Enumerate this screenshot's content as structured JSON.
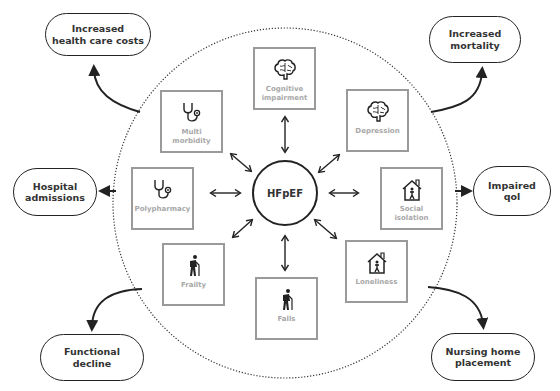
{
  "diagram": {
    "center": {
      "label": "HFpEF"
    },
    "factors": [
      {
        "id": "cognitive-impairment",
        "label": "Cognitive\nimpairment",
        "icon": "brain-icon"
      },
      {
        "id": "multi-morbidity",
        "label": "Multi morbidity",
        "icon": "stethoscope-icon"
      },
      {
        "id": "depression",
        "label": "Depression",
        "icon": "brain-icon"
      },
      {
        "id": "polypharmacy",
        "label": "Polypharmacy",
        "icon": "stethoscope-icon"
      },
      {
        "id": "social-isolation",
        "label": "Social isolation",
        "icon": "house-person-icon"
      },
      {
        "id": "frailty",
        "label": "Frailty",
        "icon": "elderly-person-cane-icon"
      },
      {
        "id": "falls",
        "label": "Falls",
        "icon": "elderly-person-cane-icon"
      },
      {
        "id": "loneliness",
        "label": "Loneliness",
        "icon": "house-person-icon"
      }
    ],
    "outcomes": [
      {
        "id": "increased-health-care-costs",
        "label": "Increased\nhealth care costs"
      },
      {
        "id": "increased-mortality",
        "label": "Increased\nmortality"
      },
      {
        "id": "hospital-admissions",
        "label": "Hospital\nadmissions"
      },
      {
        "id": "impaired-qol",
        "label": "Impaired\nqol"
      },
      {
        "id": "functional-decline",
        "label": "Functional\ndecline"
      },
      {
        "id": "nursing-home-placement",
        "label": "Nursing home\nplacement"
      }
    ],
    "colors": {
      "line": "#222222",
      "box_border": "#9a9a9a",
      "factor_text": "#a8a8a8",
      "outcome_text": "#333333",
      "background": "#ffffff"
    }
  }
}
